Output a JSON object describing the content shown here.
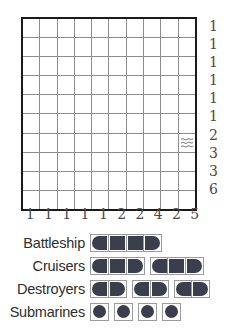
{
  "puzzle": {
    "type": "battleship-solitaire",
    "grid": {
      "rows": 10,
      "cols": 10,
      "row_clues": [
        1,
        1,
        1,
        1,
        1,
        1,
        2,
        3,
        3,
        6
      ],
      "col_clues": [
        1,
        1,
        1,
        1,
        1,
        2,
        2,
        4,
        2,
        5
      ],
      "given_marks": [
        {
          "row": 7,
          "col": 10,
          "mark": "water",
          "icon": "wave-icon"
        }
      ]
    }
  },
  "fleet": {
    "rows": [
      {
        "label": "Battleship",
        "ships": [
          {
            "length": 4,
            "segments": [
              "left",
              "mid",
              "mid",
              "right"
            ]
          }
        ]
      },
      {
        "label": "Cruisers",
        "ships": [
          {
            "length": 3,
            "segments": [
              "left",
              "mid",
              "right"
            ]
          },
          {
            "length": 3,
            "segments": [
              "left",
              "mid",
              "right"
            ]
          }
        ]
      },
      {
        "label": "Destroyers",
        "ships": [
          {
            "length": 2,
            "segments": [
              "left",
              "right"
            ]
          },
          {
            "length": 2,
            "segments": [
              "left",
              "right"
            ]
          },
          {
            "length": 2,
            "segments": [
              "left",
              "right"
            ]
          }
        ]
      },
      {
        "label": "Submarines",
        "ships": [
          {
            "length": 1,
            "segments": [
              "sub"
            ]
          },
          {
            "length": 1,
            "segments": [
              "sub"
            ]
          },
          {
            "length": 1,
            "segments": [
              "sub"
            ]
          },
          {
            "length": 1,
            "segments": [
              "sub"
            ]
          }
        ]
      }
    ]
  },
  "colors": {
    "ship_fill": "#3b3f4d",
    "grid_border": "#1a1a1a",
    "grid_line": "#8d8d8d",
    "cell_border": "#9a9a9a",
    "clue_text": "#4a4a4a",
    "label_text": "#2e2e2e",
    "background": "#ffffff"
  }
}
